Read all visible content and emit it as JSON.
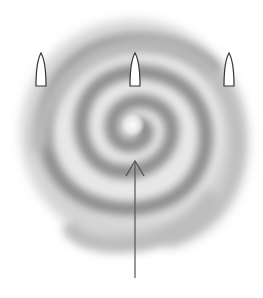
{
  "diagram": {
    "type": "spiral-with-flames-and-arrow",
    "background": "#ffffff",
    "spiral": {
      "center": [
        133,
        125
      ],
      "color": "#8a8a8a",
      "core_color": "#ffffff",
      "turns": 3
    },
    "flames": [
      {
        "id": "left",
        "x": 41,
        "top": 53,
        "bottom": 86,
        "width": 10
      },
      {
        "id": "center",
        "x": 135,
        "top": 53,
        "bottom": 86,
        "width": 10
      },
      {
        "id": "right",
        "x": 229,
        "top": 53,
        "bottom": 86,
        "width": 10
      }
    ],
    "arrow": {
      "x": 135,
      "tip_y": 161,
      "tail_y": 278,
      "color": "#555555",
      "direction": "up"
    }
  }
}
